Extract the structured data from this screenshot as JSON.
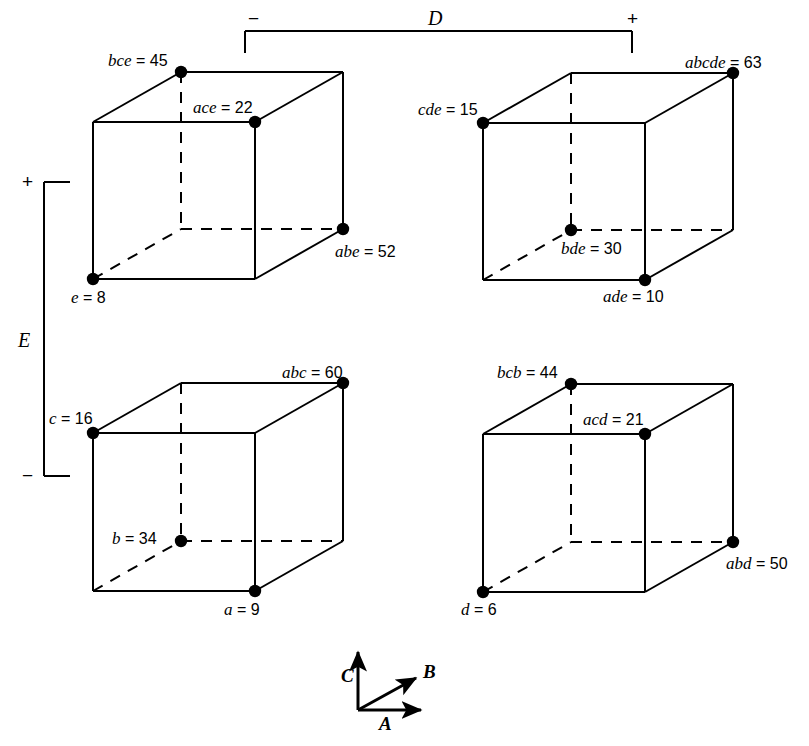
{
  "figure": {
    "background": "#ffffff",
    "stroke": "#000000",
    "width": 809,
    "height": 746
  },
  "brackets": {
    "horizontal": {
      "letter": "D",
      "minus": "−",
      "plus": "+",
      "x1": 245,
      "x2": 632,
      "y": 31,
      "tick": 22,
      "letter_x": 428,
      "letter_y": 8
    },
    "vertical": {
      "letter": "E",
      "plus": "+",
      "minus": "−",
      "x": 44,
      "y1": 182,
      "y2": 476,
      "tick": 26,
      "letter_x": 18,
      "letter_y": 330
    }
  },
  "cubes": [
    {
      "id": "cube-top-left",
      "origin_x": 93,
      "origin_y": 122,
      "width": 162,
      "height": 157,
      "dx": 88,
      "dy": -50,
      "points": [
        {
          "name": "bce",
          "value": "45",
          "vertex": "back-top-left",
          "label_x": 108,
          "label_y": 52,
          "dot": true
        },
        {
          "name": "ace",
          "value": "22",
          "vertex": "front-top-right",
          "label_x": 193,
          "label_y": 99,
          "dot": true
        },
        {
          "name": "abe",
          "value": "52",
          "vertex": "back-bottom-right",
          "label_x": 335,
          "label_y": 243,
          "dot": true
        },
        {
          "name": "e",
          "value": "8",
          "vertex": "front-bottom-left",
          "label_x": 71,
          "label_y": 289,
          "dot": true
        }
      ]
    },
    {
      "id": "cube-top-right",
      "origin_x": 483,
      "origin_y": 123,
      "width": 162,
      "height": 157,
      "dx": 88,
      "dy": -50,
      "points": [
        {
          "name": "abcde",
          "value": "63",
          "vertex": "back-top-right",
          "label_x": 685,
          "label_y": 54,
          "dot": true
        },
        {
          "name": "cde",
          "value": "15",
          "vertex": "front-top-left",
          "label_x": 418,
          "label_y": 101,
          "dot": true
        },
        {
          "name": "bde",
          "value": "30",
          "vertex": "hidden",
          "label_x": 561,
          "label_y": 240,
          "dot": true
        },
        {
          "name": "ade",
          "value": "10",
          "vertex": "front-bottom-right",
          "label_x": 603,
          "label_y": 288,
          "dot": true
        }
      ]
    },
    {
      "id": "cube-bottom-left",
      "origin_x": 93,
      "origin_y": 433,
      "width": 162,
      "height": 158,
      "dx": 88,
      "dy": -50,
      "points": [
        {
          "name": "abc",
          "value": "60",
          "vertex": "back-top-right",
          "label_x": 282,
          "label_y": 364,
          "dot": true
        },
        {
          "name": "c",
          "value": "16",
          "vertex": "front-top-left",
          "label_x": 49,
          "label_y": 410,
          "dot": true
        },
        {
          "name": "b",
          "value": "34",
          "vertex": "hidden",
          "label_x": 112,
          "label_y": 530,
          "dot": true
        },
        {
          "name": "a",
          "value": "9",
          "vertex": "front-bottom-right",
          "label_x": 224,
          "label_y": 601,
          "dot": true
        }
      ]
    },
    {
      "id": "cube-bottom-right",
      "origin_x": 483,
      "origin_y": 434,
      "width": 162,
      "height": 158,
      "dx": 88,
      "dy": -50,
      "points": [
        {
          "name": "bcb",
          "value": "44",
          "vertex": "back-top-left",
          "label_x": 497,
          "label_y": 364,
          "dot": true
        },
        {
          "name": "acd",
          "value": "21",
          "vertex": "front-top-right",
          "label_x": 583,
          "label_y": 411,
          "dot": true
        },
        {
          "name": "abd",
          "value": "50",
          "vertex": "back-bottom-right",
          "label_x": 726,
          "label_y": 555,
          "dot": true
        },
        {
          "name": "d",
          "value": "6",
          "vertex": "front-bottom-left",
          "label_x": 461,
          "label_y": 601,
          "dot": true
        }
      ]
    }
  ],
  "axis_key": {
    "origin_x": 358,
    "origin_y": 710,
    "axes": [
      {
        "label": "C",
        "dir": "up",
        "tip_x": 358,
        "tip_y": 652,
        "label_x": 341,
        "label_y": 666
      },
      {
        "label": "B",
        "dir": "diagonal",
        "tip_x": 416,
        "tip_y": 678,
        "label_x": 423,
        "label_y": 662
      },
      {
        "label": "A",
        "dir": "right",
        "tip_x": 421,
        "tip_y": 710,
        "label_x": 379,
        "label_y": 714
      }
    ]
  },
  "chart_data": {
    "type": "cube-plot",
    "factors": [
      "A",
      "B",
      "C",
      "D",
      "E"
    ],
    "outer_factors": {
      "columns": "D",
      "rows": "E"
    },
    "column_levels": [
      "−",
      "+"
    ],
    "row_levels": [
      "+",
      "−"
    ],
    "panels": [
      {
        "panel": "D = −, E = +",
        "treatments": [
          {
            "label": "e",
            "value": 8
          },
          {
            "label": "ace",
            "value": 22
          },
          {
            "label": "bce",
            "value": 45
          },
          {
            "label": "abe",
            "value": 52
          }
        ]
      },
      {
        "panel": "D = +, E = +",
        "treatments": [
          {
            "label": "cde",
            "value": 15
          },
          {
            "label": "ade",
            "value": 10
          },
          {
            "label": "bde",
            "value": 30
          },
          {
            "label": "abcde",
            "value": 63
          }
        ]
      },
      {
        "panel": "D = −, E = −",
        "treatments": [
          {
            "label": "c",
            "value": 16
          },
          {
            "label": "a",
            "value": 9
          },
          {
            "label": "b",
            "value": 34
          },
          {
            "label": "abc",
            "value": 60
          }
        ]
      },
      {
        "panel": "D = +, E = −",
        "treatments": [
          {
            "label": "d",
            "value": 6
          },
          {
            "label": "acd",
            "value": 21
          },
          {
            "label": "bcb",
            "value": 44
          },
          {
            "label": "abd",
            "value": 50
          }
        ]
      }
    ],
    "all_values": [
      8,
      22,
      45,
      52,
      15,
      10,
      30,
      63,
      16,
      9,
      34,
      60,
      6,
      21,
      44,
      50
    ],
    "grid": false,
    "legend": "axis key: A (right), B (diagonal), C (up)"
  }
}
